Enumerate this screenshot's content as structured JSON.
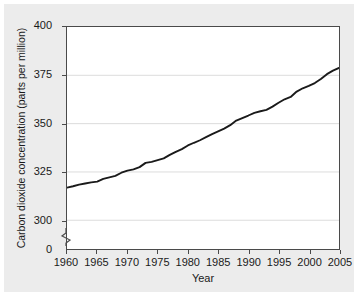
{
  "chart_data": {
    "type": "line",
    "title": "",
    "xlabel": "Year",
    "ylabel": "Carbon dioxide concentration (parts per million)",
    "xlim": [
      1960,
      2005
    ],
    "ylim": [
      290,
      400
    ],
    "yticks": [
      400,
      375,
      350,
      325,
      300,
      0
    ],
    "ytick_labels": [
      "400",
      "375",
      "350",
      "325",
      "300",
      "0"
    ],
    "xticks": [
      1960,
      1965,
      1970,
      1975,
      1980,
      1985,
      1990,
      1995,
      2000,
      2005
    ],
    "xtick_labels": [
      "1960",
      "1965",
      "1970",
      "1975",
      "1980",
      "1985",
      "1990",
      "1995",
      "2000",
      "2005"
    ],
    "grid": "horizontal",
    "axis_break": true,
    "legend": "none",
    "line_color": "#1a1a1a",
    "grid_color": "#dcdcdc",
    "plot_background": "#ffffff",
    "figure_background": "#ececec",
    "series": [
      {
        "name": "Carbon dioxide concentration",
        "x": [
          1960,
          1961,
          1962,
          1963,
          1964,
          1965,
          1966,
          1967,
          1968,
          1969,
          1970,
          1971,
          1972,
          1973,
          1974,
          1975,
          1976,
          1977,
          1978,
          1979,
          1980,
          1981,
          1982,
          1983,
          1984,
          1985,
          1986,
          1987,
          1988,
          1989,
          1990,
          1991,
          1992,
          1993,
          1994,
          1995,
          1996,
          1997,
          1998,
          1999,
          2000,
          2001,
          2002,
          2003,
          2004,
          2005
        ],
        "values": [
          316.9,
          317.6,
          318.4,
          319.0,
          319.6,
          320.0,
          321.4,
          322.2,
          323.0,
          324.6,
          325.7,
          326.3,
          327.5,
          329.7,
          330.2,
          331.1,
          332.0,
          333.8,
          335.4,
          336.8,
          338.7,
          340.1,
          341.4,
          343.0,
          344.6,
          346.0,
          347.4,
          349.2,
          351.6,
          352.9,
          354.2,
          355.6,
          356.4,
          357.1,
          358.8,
          360.8,
          362.6,
          363.8,
          366.6,
          368.3,
          369.5,
          371.0,
          373.1,
          375.6,
          377.4,
          378.8
        ]
      }
    ]
  }
}
